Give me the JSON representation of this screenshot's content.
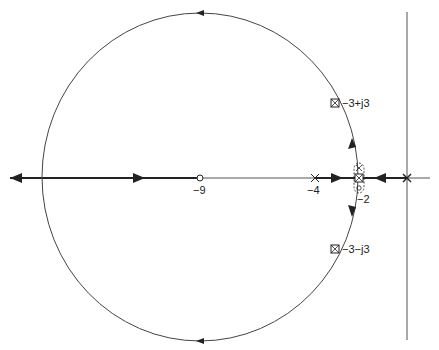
{
  "diagram": {
    "type": "root-locus",
    "colors": {
      "ink": "#222222",
      "thin": "#555555"
    },
    "labels": {
      "neg9": "−9",
      "neg4": "−4",
      "neg2": "−2",
      "upper_pole": "−3+j3",
      "lower_pole": "−3−j3"
    },
    "points": [
      {
        "name": "zero-at-neg9",
        "kind": "zero",
        "re": -9,
        "im": 0
      },
      {
        "name": "pole-at-neg4",
        "kind": "pole",
        "re": -4,
        "im": 0
      },
      {
        "name": "pole-zero-cancel-at-neg2",
        "kind": "cancelled",
        "re": -2,
        "im": 0
      },
      {
        "name": "pole-at-origin",
        "kind": "pole",
        "re": 0,
        "im": 0
      },
      {
        "name": "closed-loop-pole-upper",
        "kind": "boxed-pole",
        "re": -3,
        "im": 3
      },
      {
        "name": "closed-loop-pole-lower",
        "kind": "boxed-pole",
        "re": -3,
        "im": -3
      }
    ]
  }
}
